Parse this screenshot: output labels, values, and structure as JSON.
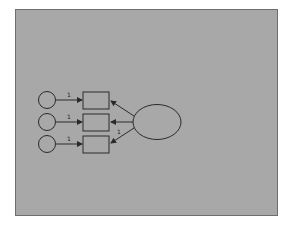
{
  "diagram": {
    "type": "path-diagram",
    "background_color": "#a8a8a8",
    "stroke_color": "#2a2a2a",
    "latent_factor": {
      "shape": "ellipse",
      "label": ""
    },
    "indicators": [
      {
        "shape": "rectangle",
        "label": ""
      },
      {
        "shape": "rectangle",
        "label": ""
      },
      {
        "shape": "rectangle",
        "label": ""
      }
    ],
    "error_terms": [
      {
        "shape": "circle",
        "label": "",
        "path_label": "1"
      },
      {
        "shape": "circle",
        "label": "",
        "path_label": "1"
      },
      {
        "shape": "circle",
        "label": "",
        "path_label": "1"
      }
    ],
    "loadings": [
      {
        "to": "indicator-1",
        "label": ""
      },
      {
        "to": "indicator-2",
        "label": ""
      },
      {
        "to": "indicator-3",
        "label": "1"
      }
    ]
  }
}
